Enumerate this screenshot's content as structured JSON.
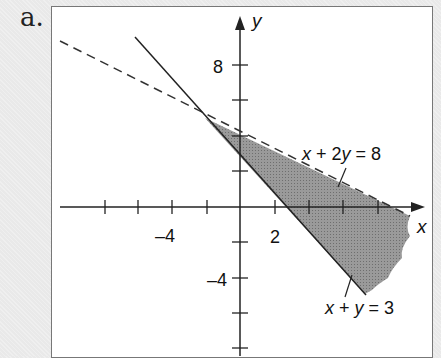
{
  "figure": {
    "part_label": "a.",
    "x_axis_label": "x",
    "y_axis_label": "y",
    "x_tick_labels": [
      {
        "value": -4,
        "text": "–4"
      },
      {
        "value": 2,
        "text": "2"
      }
    ],
    "y_tick_labels": [
      {
        "value": 8,
        "text": "8"
      },
      {
        "value": -4,
        "text": "–4"
      }
    ],
    "lines": [
      {
        "equation": "x + 2y = 8",
        "style": "dashed",
        "label_parts": [
          "x",
          " + 2",
          "y",
          " = 8"
        ]
      },
      {
        "equation": "x + y = 3",
        "style": "solid",
        "label_parts": [
          "x",
          " + ",
          "y",
          " = 3"
        ]
      }
    ],
    "shaded_region": "x + y >= 3 and x + 2y < 8",
    "intersection": "(-2, 5)",
    "colors": {
      "shade": "#8a8a8a",
      "line": "#222222",
      "frame_bg": "#ffffff",
      "page_bg": "#e9e9e9"
    }
  }
}
